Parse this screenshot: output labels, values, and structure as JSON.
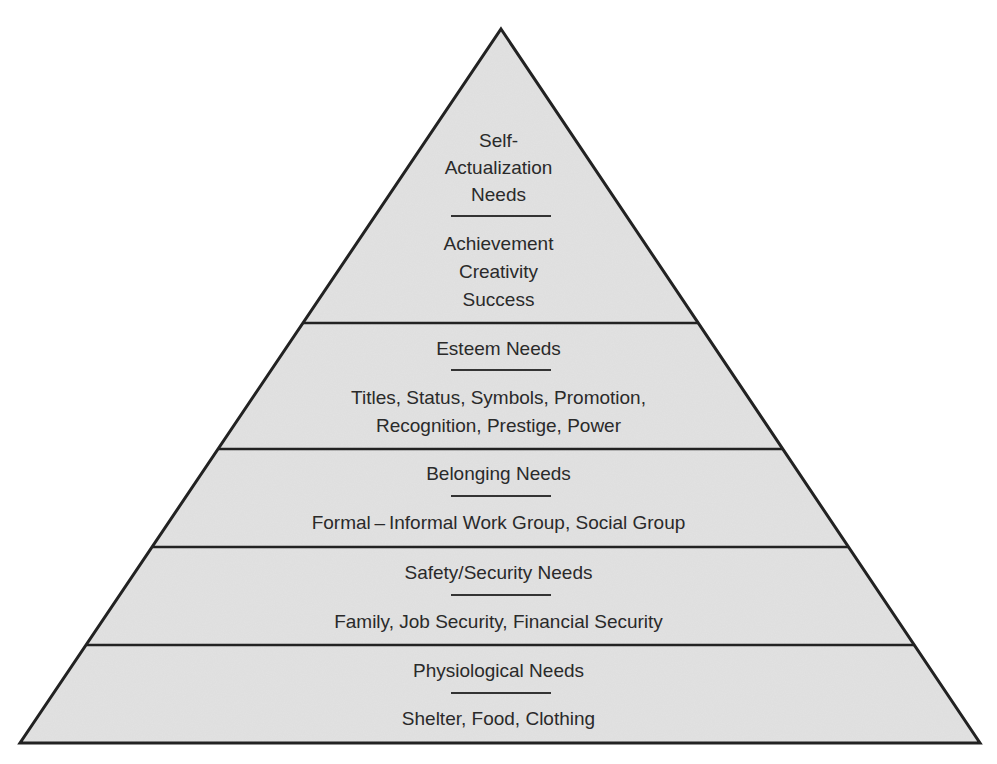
{
  "diagram": {
    "type": "pyramid",
    "fill_color": "#e2e2e2",
    "stroke_color": "#222222",
    "levels": [
      {
        "title_lines": [
          "Self-",
          "Actualization",
          "Needs"
        ],
        "item_lines": [
          "Achievement",
          "Creativity",
          "Success"
        ]
      },
      {
        "title_lines": [
          "Esteem Needs"
        ],
        "item_lines": [
          "Titles, Status, Symbols, Promotion,",
          "Recognition, Prestige, Power"
        ]
      },
      {
        "title_lines": [
          "Belonging Needs"
        ],
        "item_lines": [
          "Formal – Informal Work Group, Social Group"
        ]
      },
      {
        "title_lines": [
          "Safety/Security Needs"
        ],
        "item_lines": [
          "Family, Job Security, Financial Security"
        ]
      },
      {
        "title_lines": [
          "Physiological Needs"
        ],
        "item_lines": [
          "Shelter, Food, Clothing"
        ]
      }
    ]
  }
}
